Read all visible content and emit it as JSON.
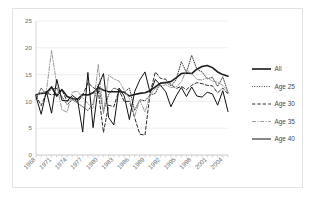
{
  "chart_data": {
    "type": "line",
    "title": "",
    "subtitle": "",
    "xlabel": "",
    "ylabel": "",
    "xlim": [
      1968,
      2005
    ],
    "ylim": [
      0,
      25
    ],
    "yticks": [
      0,
      5,
      10,
      15,
      20,
      25
    ],
    "ytick_labels": [
      "0",
      "5",
      "10",
      "15",
      "20",
      "25"
    ],
    "xtick_labels": [
      "1968",
      "1971",
      "1974",
      "1977",
      "1980",
      "1983",
      "1986",
      "1989",
      "1992",
      "1995",
      "1998",
      "2001",
      "2004"
    ],
    "x": [
      1968,
      1969,
      1970,
      1971,
      1972,
      1973,
      1974,
      1975,
      1976,
      1977,
      1978,
      1979,
      1980,
      1981,
      1982,
      1983,
      1984,
      1985,
      1986,
      1987,
      1988,
      1989,
      1990,
      1991,
      1992,
      1993,
      1994,
      1995,
      1996,
      1997,
      1998,
      1999,
      2000,
      2001,
      2002,
      2003,
      2004,
      2005
    ],
    "grid": true,
    "grid_axis": "y",
    "legend_position": "right",
    "series": [
      {
        "name": "All",
        "style": "solid",
        "color": "#1a1a1a",
        "width": 1.6,
        "values": [
          11.2,
          11.5,
          11.6,
          12.7,
          11.0,
          12.2,
          10.9,
          10.5,
          10.4,
          11.3,
          11.2,
          11.6,
          12.6,
          12.1,
          11.8,
          11.8,
          11.8,
          11.7,
          11.0,
          11.3,
          11.5,
          11.6,
          12.0,
          12.7,
          13.4,
          13.5,
          13.7,
          14.4,
          15.2,
          15.3,
          15.2,
          16.0,
          16.5,
          16.7,
          16.3,
          15.5,
          15.0,
          14.7
        ]
      },
      {
        "name": "Age 25",
        "style": "dotted",
        "color": "#3b3b3b",
        "width": 1.0,
        "values": [
          10.4,
          12.5,
          11.2,
          12.4,
          12.4,
          10.9,
          9.4,
          10.3,
          9.7,
          9.0,
          8.3,
          9.6,
          13.2,
          8.1,
          11.3,
          12.5,
          12.1,
          11.7,
          12.5,
          8.3,
          10.3,
          10.1,
          11.2,
          11.5,
          13.5,
          13.6,
          12.9,
          14.0,
          17.4,
          15.4,
          18.6,
          16.0,
          15.5,
          14.2,
          14.5,
          12.8,
          14.6,
          11.6
        ]
      },
      {
        "name": "Age 30",
        "style": "dashed",
        "color": "#2b2b2b",
        "width": 1.0,
        "values": [
          11.1,
          9.2,
          11.6,
          11.2,
          11.5,
          12.1,
          10.0,
          10.7,
          9.9,
          11.1,
          13.5,
          12.6,
          12.0,
          4.2,
          9.3,
          9.0,
          12.1,
          10.0,
          10.0,
          7.0,
          3.9,
          3.7,
          11.6,
          15.5,
          14.3,
          14.1,
          13.2,
          12.4,
          12.8,
          12.2,
          13.0,
          13.5,
          13.3,
          13.0,
          12.9,
          11.6,
          12.5,
          11.4
        ]
      },
      {
        "name": "Age 35",
        "style": "dashdot",
        "color": "#9a9a9a",
        "width": 1.0,
        "values": [
          10.9,
          11.6,
          11.9,
          19.5,
          13.1,
          8.4,
          8.0,
          11.7,
          11.9,
          10.7,
          9.6,
          8.6,
          16.9,
          7.7,
          14.9,
          14.2,
          13.8,
          12.1,
          10.5,
          7.2,
          10.3,
          8.0,
          11.3,
          12.4,
          12.8,
          13.1,
          12.6,
          12.7,
          13.6,
          15.9,
          15.2,
          14.1,
          14.0,
          14.4,
          13.8,
          13.6,
          13.0,
          11.8
        ]
      },
      {
        "name": "Age 40",
        "style": "solid",
        "color": "#111111",
        "width": 1.0,
        "values": [
          10.9,
          7.6,
          11.9,
          7.8,
          14.1,
          10.2,
          10.1,
          11.1,
          10.4,
          4.3,
          15.4,
          5.1,
          12.8,
          15.2,
          7.0,
          5.6,
          12.5,
          11.0,
          6.6,
          11.8,
          14.0,
          15.5,
          11.6,
          14.1,
          13.0,
          11.8,
          9.0,
          11.0,
          12.6,
          10.9,
          12.7,
          11.0,
          10.8,
          11.7,
          11.4,
          9.3,
          12.0,
          8.1
        ]
      }
    ]
  },
  "legend": {
    "items": [
      {
        "label": "All"
      },
      {
        "label": "Age 25"
      },
      {
        "label": "Age 30"
      },
      {
        "label": "Age 35"
      },
      {
        "label": "Age 40"
      }
    ]
  },
  "colors": {
    "background": "#ffffff",
    "frame": "#e3e3e3",
    "grid": "#e8e8e8",
    "axis": "#c9c9c9",
    "tick_text": "#6d6d6d",
    "legend_text": "#4a4a4a"
  }
}
